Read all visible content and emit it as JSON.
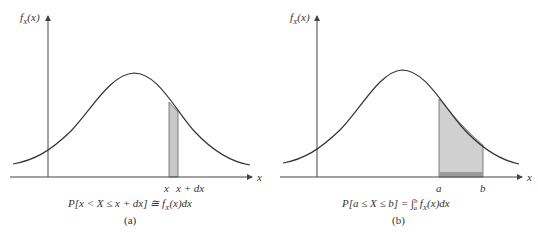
{
  "figure": {
    "panels": [
      {
        "id": "a",
        "y_axis_label": "f",
        "y_axis_label_sub": "X",
        "y_axis_label_arg": "(x)",
        "x_axis_label": "x",
        "tick_labels": [
          "x",
          "x + dx"
        ],
        "formula": "P[x < X ≤ x + dx] ≅ f",
        "formula_sub": "X",
        "formula_tail": "(x)dx",
        "caption": "(a)"
      },
      {
        "id": "b",
        "y_axis_label": "f",
        "y_axis_label_sub": "X",
        "y_axis_label_arg": "(x)",
        "x_axis_label": "x",
        "tick_labels": [
          "a",
          "b"
        ],
        "formula": "P[a ≤ X ≤ b] = ∫",
        "formula_int_upper": "b",
        "formula_int_lower": "a",
        "formula_f": " f",
        "formula_sub": "X",
        "formula_tail": "(x)dx",
        "caption": "(b)"
      }
    ],
    "colors": {
      "curve": "#333333",
      "axis": "#444444",
      "shade": "#c8c8c8",
      "shade_dark": "#9a9a9a"
    }
  }
}
